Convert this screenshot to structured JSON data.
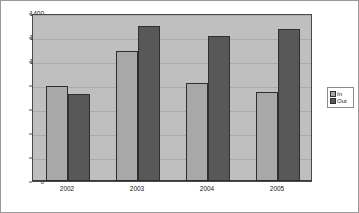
{
  "chart_data": {
    "type": "bar",
    "title": "",
    "xlabel": "",
    "ylabel": "",
    "categories": [
      "2002",
      "2003",
      "2004",
      "2005"
    ],
    "series": [
      {
        "name": "In",
        "values": [
          795,
          1080,
          815,
          740
        ],
        "color": "#a8a8a8"
      },
      {
        "name": "Out",
        "values": [
          725,
          1290,
          1210,
          1270
        ],
        "color": "#585858"
      }
    ],
    "ylim": [
      0,
      1400
    ],
    "ytick_values": [
      0,
      200,
      400,
      600,
      800,
      1000,
      1200,
      1400
    ],
    "ytick_labels": [
      "0",
      "200",
      "400",
      "600",
      "800",
      "1000",
      "1200",
      "1400"
    ],
    "grid": true,
    "legend_position": "right",
    "plot_background": "#bfbfbf",
    "chart_background": "#ffffff",
    "border_color": "#4a4a4a"
  },
  "legend": {
    "entries": [
      {
        "label": "In"
      },
      {
        "label": "Out"
      }
    ]
  }
}
